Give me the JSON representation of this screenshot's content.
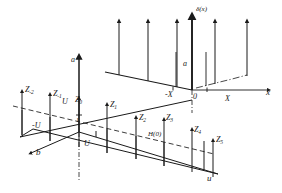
{
  "figure": {
    "type": "3d-perspective-diagram",
    "stroke_color": "#1a1a1a",
    "background": "#ffffff"
  },
  "upper_plane": {
    "vertical_axis_label": "a",
    "function_label": "δ(x)",
    "horizontal_axis_label": "x",
    "tick_labels": [
      {
        "text": "-X",
        "id": "tick-minus-x"
      },
      {
        "text": "0",
        "id": "tick-origin"
      },
      {
        "text": "X",
        "id": "tick-plus-x"
      }
    ],
    "impulse_count": 6,
    "stub_count": 2
  },
  "lower_plane": {
    "vertical_axis_label": "a",
    "left_axis_label": "b",
    "right_axis_label": "u",
    "unit_tick_label": "1",
    "tick_labels": [
      {
        "text": "-U",
        "id": "tick-minus-u"
      },
      {
        "text": "U",
        "id": "tick-plus-u"
      },
      {
        "text": "U",
        "id": "tick-u-upper"
      }
    ],
    "transfer_label": "H(0)",
    "samples": [
      {
        "base": "Z",
        "sub": "-2"
      },
      {
        "base": "Z",
        "sub": "-1"
      },
      {
        "base": "Z",
        "sub": "0"
      },
      {
        "base": "Z",
        "sub": "1"
      },
      {
        "base": "Z",
        "sub": "2"
      },
      {
        "base": "Z",
        "sub": "3"
      },
      {
        "base": "Z",
        "sub": "4"
      },
      {
        "base": "Z",
        "sub": "5"
      }
    ]
  }
}
